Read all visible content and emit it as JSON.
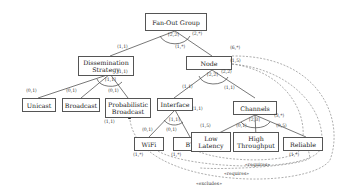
{
  "diagram": {
    "type": "feature-model",
    "nodes": {
      "root": {
        "label": "Fan-Out Group"
      },
      "dissemination": {
        "label": "Dissemination Strategy"
      },
      "node": {
        "label": "Node"
      },
      "unicast": {
        "label": "Unicast"
      },
      "broadcast": {
        "label": "Broadcast"
      },
      "probabilistic": {
        "label": "Probabilistic Broadcast"
      },
      "interface": {
        "label": "Interface"
      },
      "channels": {
        "label": "Channels"
      },
      "wifi": {
        "label": "WiFi"
      },
      "bt": {
        "label": "BT"
      },
      "low_latency": {
        "label": "Low Latency"
      },
      "high_throughput": {
        "label": "High Throughput"
      },
      "reliable": {
        "label": "Reliable"
      }
    },
    "group_cardinalities": {
      "root": "[2,2]",
      "dissemination": "[1,1]",
      "node": "[2,2]",
      "interface": "[1,1]",
      "channels": "[2,3]"
    },
    "cardinalities": {
      "root_dissemination": "⟨1,1⟩",
      "root_node_parent": "⟨2,*⟩",
      "root_node_child": "⟨1,*⟩",
      "unicast": "⟨0,1⟩",
      "broadcast": "⟨0,1⟩",
      "probabilistic": "⟨0,1⟩",
      "dissemination_right": "⟨1,1⟩",
      "node_exclude_src": "⟨6,*⟩",
      "node_require_src": "⟨1,5⟩",
      "node_interface": "⟨1,1⟩",
      "node_channels_parent": "⟨2,2⟩",
      "node_channels_child": "⟨1,1⟩",
      "interface_right": "⟨1,1⟩",
      "wifi": "⟨0,1⟩",
      "bt": "⟨0,1⟩",
      "low_latency": "⟨1,5⟩",
      "high_throughput": "⟨0,1⟩",
      "reliable": "⟨0,5⟩",
      "channels_right": "⟨3,*⟩",
      "probabilistic_target": "⟨1,1⟩",
      "wifi_target": "⟨1,*⟩",
      "bt_target": "⟨1,*⟩",
      "reliable_target": "⟨1,*⟩"
    },
    "constraints": [
      {
        "label": "«requires»"
      },
      {
        "label": "«requires»"
      },
      {
        "label": "«excludes»"
      }
    ]
  }
}
